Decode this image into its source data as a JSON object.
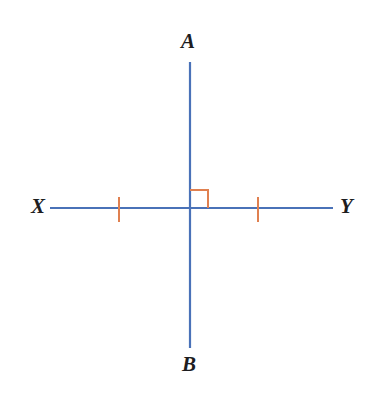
{
  "figure": {
    "background_color": "#ffffff",
    "line_color": "#4a72b8",
    "mark_color": "#e08050",
    "label_color": "#1d1d1f"
  },
  "labels": {
    "top": "A",
    "bottom": "B",
    "left": "X",
    "right": "Y"
  },
  "geometry": {
    "intersection": {
      "x": 190,
      "y": 208
    },
    "vertical_line": {
      "name": "AB",
      "x": 190,
      "y_top": 62,
      "y_bottom": 348,
      "stroke_width": 2.2
    },
    "horizontal_line": {
      "name": "XY",
      "y": 208,
      "x_left": 50,
      "x_right": 333,
      "stroke_width": 2.2
    },
    "right_angle_mark": {
      "quadrant": "upper-right",
      "size": 18,
      "x": 190,
      "y": 208,
      "stroke_width": 2
    },
    "tick_marks": [
      {
        "name": "tick-left",
        "x": 119,
        "y_top": 197,
        "y_bottom": 222
      },
      {
        "name": "tick-right",
        "x": 258,
        "y_top": 197,
        "y_bottom": 222
      }
    ]
  }
}
